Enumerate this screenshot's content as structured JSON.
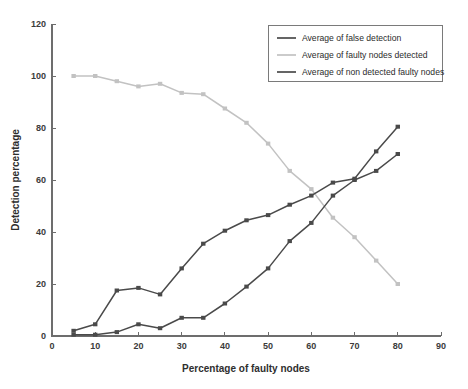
{
  "chart_data": {
    "type": "line",
    "title": "",
    "xlabel": "Percentage of faulty nodes",
    "ylabel": "Detection percentage",
    "xlim": [
      0,
      90
    ],
    "ylim": [
      0,
      120
    ],
    "xticks": [
      0,
      10,
      20,
      30,
      40,
      50,
      60,
      70,
      80,
      90
    ],
    "yticks": [
      0,
      20,
      40,
      60,
      80,
      100,
      120
    ],
    "grid": false,
    "legend_position": "top-right",
    "x": [
      5,
      10,
      15,
      20,
      25,
      30,
      35,
      40,
      45,
      50,
      55,
      60,
      65,
      70,
      75,
      80
    ],
    "series": [
      {
        "name": "Average of false detection",
        "color": "#4a4a4a",
        "marker": "square",
        "values": [
          0.5,
          0.5,
          1.5,
          4.5,
          3,
          7,
          7,
          12.5,
          19,
          26,
          36.5,
          43.5,
          54,
          60,
          63.5,
          70
        ]
      },
      {
        "name": "Average of faulty nodes detected",
        "color": "#c2c2c2",
        "marker": "square",
        "values": [
          100,
          100,
          98,
          96,
          97,
          93.5,
          93,
          87.5,
          82,
          74,
          63.5,
          56.5,
          45.5,
          38,
          29,
          20
        ]
      },
      {
        "name": "Average  of non detected faulty nodes",
        "color": "#4a4a4a",
        "marker": "square",
        "values": [
          2,
          4.5,
          17.5,
          18.5,
          16,
          26,
          35.5,
          40.5,
          44.5,
          46.5,
          50.5,
          54,
          59,
          60.5,
          71,
          80.5
        ]
      }
    ]
  },
  "legend": {
    "entries": [
      "Average of false detection",
      "Average of faulty nodes detected",
      "Average  of non detected faulty nodes"
    ]
  },
  "colors": {
    "axis": "#6d6d6d",
    "text": "#2e2e2e",
    "dark_series": "#4a4a4a",
    "light_series": "#c2c2c2",
    "background": "#ffffff"
  }
}
